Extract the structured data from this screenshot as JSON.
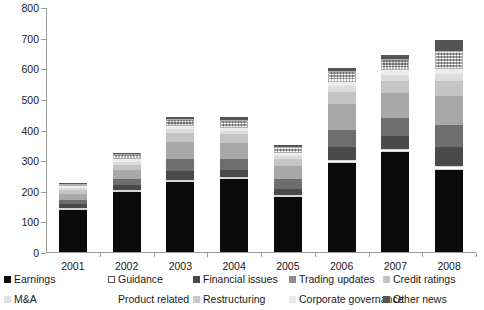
{
  "chart_data": {
    "type": "bar",
    "subtype": "stacked-bar",
    "title": "",
    "xlabel": "",
    "ylabel": "",
    "ylim": [
      0,
      800
    ],
    "ytick_step": 100,
    "yticks": [
      0,
      100,
      200,
      300,
      400,
      500,
      600,
      700,
      800
    ],
    "ytick_labels": [
      "0",
      "100",
      "200",
      "300",
      "400",
      "500",
      "600",
      "700",
      "800"
    ],
    "grid": false,
    "legend_position": "bottom",
    "categories": [
      "2001",
      "2002",
      "2003",
      "2004",
      "2005",
      "2006",
      "2007",
      "2008"
    ],
    "series": [
      {
        "name": "Earnings",
        "values": [
          138,
          197,
          228,
          238,
          180,
          290,
          325,
          268
        ]
      },
      {
        "name": "M&A",
        "values": [
          4,
          5,
          6,
          8,
          5,
          10,
          10,
          12
        ]
      },
      {
        "name": "Financial issues",
        "values": [
          12,
          16,
          30,
          22,
          20,
          42,
          45,
          62
        ]
      },
      {
        "name": "Trading updates",
        "values": [
          14,
          20,
          38,
          36,
          32,
          56,
          58,
          72
        ]
      },
      {
        "name": "Credit ratings",
        "values": [
          18,
          28,
          56,
          52,
          42,
          86,
          82,
          95
        ]
      },
      {
        "name": "Restructuring",
        "values": [
          14,
          18,
          30,
          28,
          24,
          40,
          38,
          48
        ]
      },
      {
        "name": "Corporate governance",
        "values": [
          8,
          10,
          14,
          12,
          10,
          18,
          20,
          24
        ]
      },
      {
        "name": "Product related",
        "values": [
          6,
          8,
          10,
          10,
          8,
          14,
          16,
          18
        ]
      },
      {
        "name": "Guidance",
        "values": [
          6,
          16,
          22,
          26,
          22,
          36,
          38,
          58
        ]
      },
      {
        "name": "Other news",
        "values": [
          2,
          4,
          6,
          8,
          5,
          10,
          12,
          36
        ]
      }
    ],
    "series_colors": [
      "#0b0b0b",
      "#ffffff",
      "#4a4a4a",
      "#6e6e6e",
      "#a8a8a8",
      "#c4c4c4",
      "#dcdcdc",
      "#ececec",
      "#f0f0f0",
      "#555555"
    ],
    "totals": [
      222,
      322,
      440,
      440,
      348,
      602,
      644,
      693
    ]
  },
  "legend": {
    "row1": [
      {
        "label": "Earnings",
        "color": "#0b0b0b",
        "pattern": "solid"
      },
      {
        "label": "Guidance",
        "color": "#ffffff",
        "pattern": "hollow"
      },
      {
        "label": "Financial issues",
        "color": "#4a4a4a",
        "pattern": "solid"
      },
      {
        "label": "Trading updates",
        "color": "#8d8d8d",
        "pattern": "solid"
      },
      {
        "label": "Credit ratings",
        "color": "#c4c4c4",
        "pattern": "solid"
      }
    ],
    "row2": [
      {
        "label": "M&A",
        "color": "#e2e2e2",
        "pattern": "solid"
      },
      {
        "label": "Product related",
        "color": "#ffffff",
        "pattern": "none"
      },
      {
        "label": "Restructuring",
        "color": "#c9c9c9",
        "pattern": "solid"
      },
      {
        "label": "Corporate governance",
        "color": "#eaeaea",
        "pattern": "solid"
      },
      {
        "label": "Other news",
        "color": "#555555",
        "pattern": "solid"
      }
    ]
  }
}
